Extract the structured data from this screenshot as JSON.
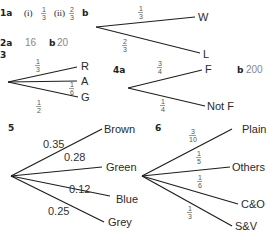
{
  "answers": {
    "q1": {
      "number": "1a",
      "part_i_label": "(i)",
      "part_i_num": "1",
      "part_i_den": "3",
      "part_ii_label": "(ii)",
      "part_ii_num": "2",
      "part_ii_den": "3",
      "part_b": "b",
      "tree": [
        {
          "num": "1",
          "den": "3",
          "outcome": "W"
        },
        {
          "num": "2",
          "den": "3",
          "outcome": "L"
        }
      ]
    },
    "q2": {
      "number": "2a",
      "a_value": "16",
      "part_b": "b",
      "b_value": "20"
    },
    "q3": {
      "number": "3",
      "tree": [
        {
          "num": "1",
          "den": "3",
          "outcome": "R"
        },
        {
          "num": "1",
          "den": "6",
          "outcome": "A"
        },
        {
          "num": "1",
          "den": "2",
          "outcome": "G"
        }
      ]
    },
    "q4": {
      "number": "4a",
      "part_b": "b",
      "b_value": "200",
      "tree": [
        {
          "num": "3",
          "den": "4",
          "outcome": "F"
        },
        {
          "num": "1",
          "den": "4",
          "outcome": "Not F"
        }
      ]
    },
    "q5": {
      "number": "5",
      "tree": [
        {
          "prob": "0.35",
          "outcome": "Brown"
        },
        {
          "prob": "0.28",
          "outcome": "Green"
        },
        {
          "prob": "0.12",
          "outcome": "Blue"
        },
        {
          "prob": "0.25",
          "outcome": "Grey"
        }
      ]
    },
    "q6": {
      "number": "6",
      "tree": [
        {
          "num": "3",
          "den": "10",
          "outcome": "Plain"
        },
        {
          "num": "1",
          "den": "5",
          "outcome": "Others"
        },
        {
          "num": "1",
          "den": "6",
          "outcome": "C&O"
        },
        {
          "num": "1",
          "den": "3",
          "outcome": "S&V"
        }
      ]
    }
  }
}
